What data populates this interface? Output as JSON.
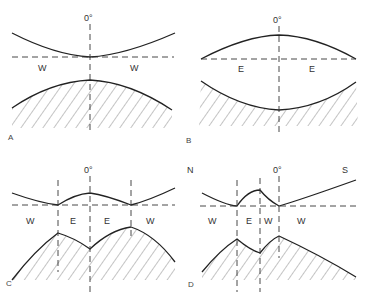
{
  "figure": {
    "panels": [
      {
        "id": "A",
        "top_label": "0°",
        "regions": [
          "W",
          "W"
        ],
        "upper_curve": "minimum at 0°, touching dashed axis",
        "lower_curve": "single hatched maximum at 0°"
      },
      {
        "id": "B",
        "top_label": "0°",
        "regions": [
          "E",
          "E"
        ],
        "upper_curve": "maximum at 0°",
        "lower_curve": "single hatched minimum at 0°"
      },
      {
        "id": "C",
        "top_label": "0°",
        "regions": [
          "W",
          "E",
          "E",
          "W"
        ],
        "upper_curve": "two minima with central bump at 0°",
        "lower_curve": "two hatched peaks with dip at 0°"
      },
      {
        "id": "D",
        "top_label": "0°",
        "left_label": "N",
        "right_label": "S",
        "regions": [
          "W",
          "E",
          "W",
          "W"
        ],
        "upper_curve": "bump between two minima, rising toward S",
        "lower_curve": "two hatched peaks, sloping down toward S"
      }
    ]
  }
}
